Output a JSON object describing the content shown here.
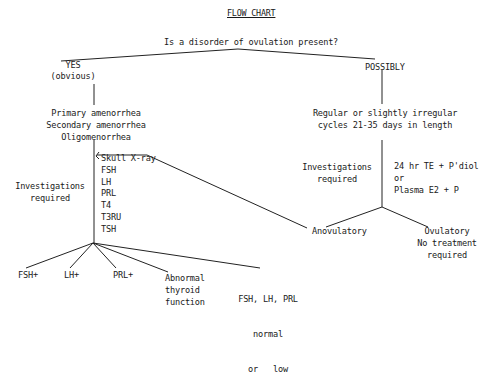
{
  "title": "FLOW CHART",
  "question": "Is a disorder of ovulation present?",
  "left_branch": {
    "label": "YES",
    "sublabel": "(obvious)",
    "conditions": [
      "Primary amenorrhea",
      "Secondary amenorrhea",
      "Oligomenorrhea"
    ],
    "investigations_label": [
      "Investigations",
      "required"
    ],
    "investigations": [
      "Skull X-ray",
      "FSH",
      "LH",
      "PRL",
      "T4",
      "T3RU",
      "TSH"
    ],
    "outcomes": [
      {
        "lines": [
          "FSH+"
        ]
      },
      {
        "lines": [
          "LH+"
        ]
      },
      {
        "lines": [
          "PRL+"
        ]
      },
      {
        "lines": [
          "Abnormal",
          "thyroid",
          "function"
        ]
      },
      {
        "lines": [
          "FSH, LH, PRL",
          "normal",
          "or   low"
        ]
      }
    ]
  },
  "right_branch": {
    "label": "POSSIBLY",
    "condition": [
      "Regular or slightly irregular",
      "cycles 21-35 days in length"
    ],
    "investigations_label": [
      "Investigations",
      "required"
    ],
    "investigations": [
      "24 hr TE + P'diol",
      "or",
      "Plasma E2 + P"
    ],
    "outcomes": [
      {
        "lines": [
          "Anovulatory"
        ]
      },
      {
        "lines": [
          "Ovulatory",
          "No treatment",
          "required"
        ]
      }
    ]
  },
  "colors": {
    "ink": "#1a1a1a",
    "background": "#ffffff"
  }
}
